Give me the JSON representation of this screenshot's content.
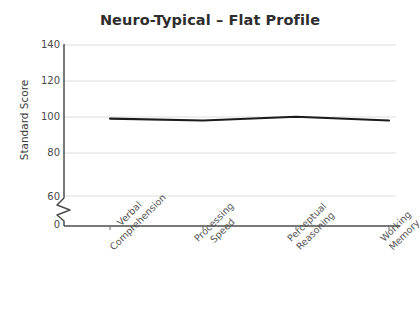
{
  "chart_data": {
    "type": "line",
    "title": "Neuro-Typical – Flat Profile",
    "xlabel": "",
    "ylabel": "Standard Score",
    "categories": [
      "Verbal\nComprehension",
      "Processing\nSpeed",
      "Perceptual\nReasoning",
      "Working\nMemory"
    ],
    "values": [
      101,
      100,
      102,
      100
    ],
    "series": [
      {
        "name": "Standard Score",
        "values": [
          101,
          100,
          102,
          100
        ],
        "color": "#1c1c1c"
      }
    ],
    "ylim": [
      0,
      145
    ],
    "yticks": [
      0,
      60,
      80,
      100,
      120,
      140
    ],
    "ytick_labels": [
      "0",
      "60",
      "80",
      "100",
      "120",
      "140"
    ],
    "y_axis_break": {
      "present": true,
      "between": [
        0,
        60
      ],
      "style": "zigzag"
    },
    "grid": {
      "horizontal": true,
      "vertical": false,
      "color": "#e9e9e9"
    },
    "legend": {
      "present": false,
      "position": "none"
    },
    "markers": false,
    "line_width": 2
  },
  "tick_labels": {
    "y": [
      "140",
      "120",
      "100",
      "80",
      "60",
      "0"
    ],
    "x": [
      {
        "line1": "Verbal",
        "line2": "Comprehension"
      },
      {
        "line1": "Processing",
        "line2": "Speed"
      },
      {
        "line1": "Perceptual",
        "line2": "Reasoning"
      },
      {
        "line1": "Working",
        "line2": "Memory"
      }
    ]
  },
  "colors": {
    "background": "#ffffff",
    "line": "#1c1c1c",
    "axis": "#4d4d4d",
    "grid": "#e9e9e9",
    "title_text": "#2e2e2e",
    "tick_text": "#4a4a4a"
  }
}
